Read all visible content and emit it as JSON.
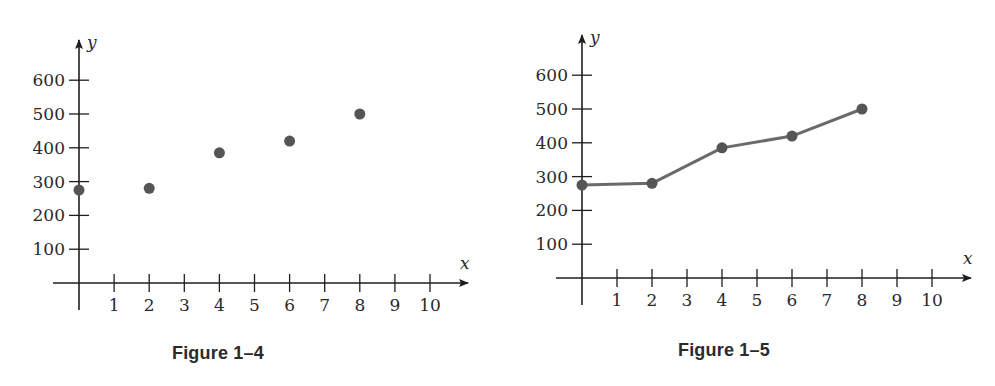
{
  "chart_data": [
    {
      "type": "scatter",
      "title": "Figure 1–4",
      "xlabel": "x",
      "ylabel": "y",
      "x": [
        0,
        2,
        4,
        6,
        8
      ],
      "y": [
        275,
        280,
        385,
        420,
        500
      ],
      "x_ticks": [
        1,
        2,
        3,
        4,
        5,
        6,
        7,
        8,
        9,
        10
      ],
      "y_ticks": [
        100,
        200,
        300,
        400,
        500,
        600
      ],
      "xlim": [
        0,
        10
      ],
      "ylim": [
        0,
        600
      ],
      "grid": false,
      "legend": null
    },
    {
      "type": "line",
      "title": "Figure 1–5",
      "xlabel": "x",
      "ylabel": "y",
      "x": [
        0,
        2,
        4,
        6,
        8
      ],
      "y": [
        275,
        280,
        385,
        420,
        500
      ],
      "x_ticks": [
        1,
        2,
        3,
        4,
        5,
        6,
        7,
        8,
        9,
        10
      ],
      "y_ticks": [
        100,
        200,
        300,
        400,
        500,
        600
      ],
      "xlim": [
        0,
        10
      ],
      "ylim": [
        0,
        600
      ],
      "grid": false,
      "legend": null,
      "markers": true
    }
  ],
  "figures": [
    {
      "caption": "Figure 1–4",
      "x_axis_label": "x",
      "y_axis_label": "y",
      "layout": {
        "ox": 79,
        "oy": 283,
        "xstep": 35.1,
        "ystep": 0.338,
        "xstart": 53,
        "xend": 468,
        "ytop": 40,
        "ybottom": 310,
        "capx": 218,
        "capy": 359
      }
    },
    {
      "caption": "Figure 1–5",
      "x_axis_label": "x",
      "y_axis_label": "y",
      "layout": {
        "ox": 582,
        "oy": 278,
        "xstep": 35.0,
        "ystep": 0.338,
        "xstart": 556,
        "xend": 971,
        "ytop": 35,
        "ybottom": 305,
        "capx": 724,
        "capy": 356
      }
    }
  ],
  "colors": {
    "axis": "#1e1e1e",
    "point": "#555555",
    "line": "#6a6a6a",
    "text": "#2a2a2a"
  }
}
